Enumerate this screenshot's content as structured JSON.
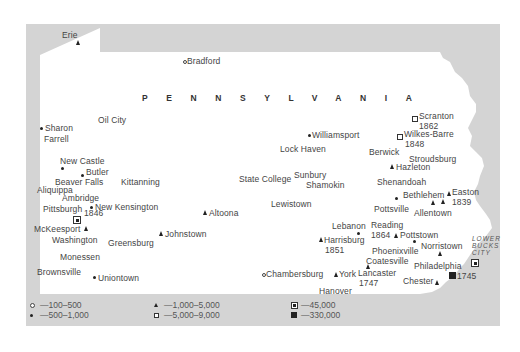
{
  "map": {
    "state_label": "PENNSYLVANIA",
    "region_label": "LOWER BUCKS CITY",
    "region_lines": [
      "LOWER",
      "BUCKS",
      "CITY"
    ],
    "places": [
      {
        "name": "Erie",
        "symbol": "triangle",
        "category": "1,000-5,000"
      },
      {
        "name": "Bradford",
        "symbol": "open-circle",
        "category": "100-500"
      },
      {
        "name": "Sharon",
        "symbol": "dot",
        "category": "500-1,000"
      },
      {
        "name": "Farrell",
        "symbol": "none"
      },
      {
        "name": "Oil City",
        "symbol": "open-circle",
        "category": "100-500"
      },
      {
        "name": "New Castle",
        "symbol": "dot",
        "category": "500-1,000"
      },
      {
        "name": "Butler",
        "symbol": "dot",
        "category": "500-1,000"
      },
      {
        "name": "Beaver Falls",
        "symbol": "none"
      },
      {
        "name": "Kittanning",
        "symbol": "none"
      },
      {
        "name": "Aliquippa",
        "symbol": "none"
      },
      {
        "name": "Ambridge",
        "symbol": "none"
      },
      {
        "name": "Pittsburgh",
        "symbol": "square-dot",
        "category": "45,000",
        "year": "1846"
      },
      {
        "name": "New Kensington",
        "symbol": "dot",
        "category": "500-1,000"
      },
      {
        "name": "McKeesport",
        "symbol": "triangle",
        "category": "1,000-5,000"
      },
      {
        "name": "Washington",
        "symbol": "none"
      },
      {
        "name": "Greensburg",
        "symbol": "none"
      },
      {
        "name": "Johnstown",
        "symbol": "triangle",
        "category": "1,000-5,000"
      },
      {
        "name": "Altoona",
        "symbol": "triangle",
        "category": "1,000-5,000"
      },
      {
        "name": "Monessen",
        "symbol": "none"
      },
      {
        "name": "Brownsville",
        "symbol": "none"
      },
      {
        "name": "Uniontown",
        "symbol": "dot",
        "category": "500-1,000"
      },
      {
        "name": "Williamsport",
        "symbol": "dot",
        "category": "500-1,000"
      },
      {
        "name": "Lock Haven",
        "symbol": "none"
      },
      {
        "name": "State College",
        "symbol": "none"
      },
      {
        "name": "Sunbury",
        "symbol": "none"
      },
      {
        "name": "Shamokin",
        "symbol": "none"
      },
      {
        "name": "Lewistown",
        "symbol": "none"
      },
      {
        "name": "Scranton",
        "symbol": "open-square",
        "category": "5,000-9,000",
        "year": "1862"
      },
      {
        "name": "Wilkes-Barre",
        "symbol": "open-square",
        "category": "5,000-9,000",
        "year": "1848"
      },
      {
        "name": "Berwick",
        "symbol": "none"
      },
      {
        "name": "Stroudsburg",
        "symbol": "none"
      },
      {
        "name": "Hazleton",
        "symbol": "triangle",
        "category": "1,000-5,000"
      },
      {
        "name": "Shenandoah",
        "symbol": "none"
      },
      {
        "name": "Bethlehem",
        "symbol": "triangle",
        "category": "1,000-5,000"
      },
      {
        "name": "Easton",
        "symbol": "triangle",
        "category": "1,000-5,000",
        "year": "1839"
      },
      {
        "name": "Pottsville",
        "symbol": "dot",
        "category": "500-1,000"
      },
      {
        "name": "Allentown",
        "symbol": "triangle",
        "category": "1,000-5,000"
      },
      {
        "name": "Lebanon",
        "symbol": "dot",
        "category": "500-1,000"
      },
      {
        "name": "Reading",
        "symbol": "triangle",
        "category": "1,000-5,000",
        "year": "1864"
      },
      {
        "name": "Pottstown",
        "symbol": "triangle",
        "category": "1,000-5,000"
      },
      {
        "name": "Harrisburg",
        "symbol": "triangle",
        "category": "1,000-5,000",
        "year": "1851"
      },
      {
        "name": "Phoenixville",
        "symbol": "dot",
        "category": "500-1,000"
      },
      {
        "name": "Norristown",
        "symbol": "triangle",
        "category": "1,000-5,000"
      },
      {
        "name": "Coatesville",
        "symbol": "none"
      },
      {
        "name": "Philadelphia",
        "symbol": "filled-square",
        "category": "330,000",
        "year": "1745"
      },
      {
        "name": "Lancaster",
        "symbol": "triangle",
        "category": "1,000-5,000",
        "year": "1747"
      },
      {
        "name": "York",
        "symbol": "triangle",
        "category": "1,000-5,000"
      },
      {
        "name": "Chambersburg",
        "symbol": "open-circle",
        "category": "100-500"
      },
      {
        "name": "Hanover",
        "symbol": "none"
      },
      {
        "name": "Chester",
        "symbol": "triangle",
        "category": "1,000-5,000"
      }
    ]
  },
  "labels": {
    "erie": "Erie",
    "bradford": "Bradford",
    "sharon": "Sharon",
    "farrell": "Farrell",
    "oil_city": "Oil City",
    "new_castle": "New Castle",
    "butler": "Butler",
    "beaver_falls": "Beaver Falls",
    "kittanning": "Kittanning",
    "aliquippa": "Aliquippa",
    "ambridge": "Ambridge",
    "pittsburgh": "Pittsburgh",
    "pittsburgh_year": "1846",
    "new_kensington": "New Kensington",
    "mckeesport": "McKeesport",
    "washington": "Washington",
    "greensburg": "Greensburg",
    "johnstown": "Johnstown",
    "altoona": "Altoona",
    "monessen": "Monessen",
    "brownsville": "Brownsville",
    "uniontown": "Uniontown",
    "williamsport": "Williamsport",
    "lock_haven": "Lock Haven",
    "state_college": "State College",
    "sunbury": "Sunbury",
    "shamokin": "Shamokin",
    "lewistown": "Lewistown",
    "scranton": "Scranton",
    "scranton_year": "1862",
    "wilkes_barre": "Wilkes-Barre",
    "wilkes_barre_year": "1848",
    "berwick": "Berwick",
    "stroudsburg": "Stroudsburg",
    "hazleton": "Hazleton",
    "shenandoah": "Shenandoah",
    "bethlehem": "Bethlehem",
    "easton": "Easton",
    "easton_year": "1839",
    "pottsville": "Pottsville",
    "allentown": "Allentown",
    "lebanon": "Lebanon",
    "reading": "Reading",
    "reading_year": "1864",
    "pottstown": "Pottstown",
    "harrisburg": "Harrisburg",
    "harrisburg_year": "1851",
    "phoenixville": "Phoenixville",
    "norristown": "Norristown",
    "coatesville": "Coatesville",
    "philadelphia": "Philadelphia",
    "philadelphia_year": "1745",
    "lancaster": "Lancaster",
    "lancaster_year": "1747",
    "york": "York",
    "chambersburg": "Chambersburg",
    "hanover": "Hanover",
    "chester": "Chester"
  },
  "legend": {
    "items": [
      {
        "symbol": "open-circle",
        "label": "—100–500"
      },
      {
        "symbol": "dot",
        "label": "—500–1,000"
      },
      {
        "symbol": "triangle",
        "label": "—1,000–5,000"
      },
      {
        "symbol": "open-square",
        "label": "—5,000–9,000"
      },
      {
        "symbol": "square-dot",
        "label": "—45,000"
      },
      {
        "symbol": "filled-square",
        "label": "—330,000"
      }
    ]
  },
  "colors": {
    "background": "#ffffff",
    "frame_gray": "#d4d4d4",
    "text": "#444444",
    "symbol": "#222222"
  }
}
